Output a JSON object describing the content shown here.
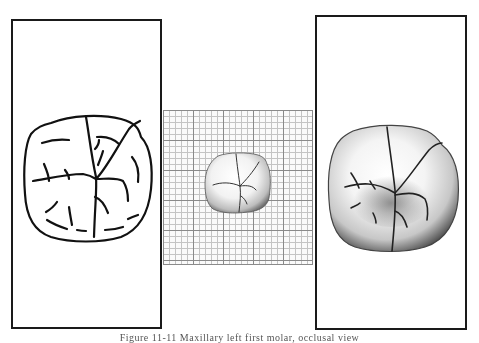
{
  "figure": {
    "panels": [
      {
        "id": "left",
        "kind": "line-drawing",
        "subject": "tooth-occlusal-outline"
      },
      {
        "id": "middle",
        "kind": "photo-on-grid",
        "subject": "tooth-occlusal-photo-small"
      },
      {
        "id": "right",
        "kind": "photo",
        "subject": "tooth-occlusal-photo-enlarged"
      }
    ],
    "grid": {
      "major_spacing_px": 30,
      "minor_spacing_px": 6,
      "major_color": "#8a8a8a",
      "minor_color": "#c4c4c4"
    },
    "border_color": "#1a1a1a",
    "caption": "Figure 11-11  Maxillary left first molar, occlusal view"
  }
}
